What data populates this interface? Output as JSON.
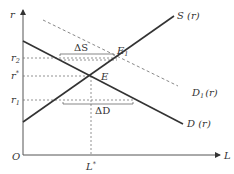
{
  "diagram": {
    "type": "supply-demand",
    "axes": {
      "y_label": "r",
      "x_label": "L",
      "origin_label": "O"
    },
    "y_ticks": [
      {
        "label": "r",
        "sub": "2",
        "y": 58
      },
      {
        "label": "r",
        "sup": "*",
        "y": 76
      },
      {
        "label": "r",
        "sub": "1",
        "y": 100
      }
    ],
    "x_ticks": [
      {
        "label": "L",
        "sup": "*",
        "x": 91
      }
    ],
    "curves": [
      {
        "name": "S (r)",
        "style": "solid"
      },
      {
        "name": "D (r)",
        "style": "solid"
      },
      {
        "name": "D1 (r)",
        "style": "dashed"
      }
    ],
    "points": {
      "E": "E",
      "E1": "E"
    },
    "annotations": {
      "delta_s": "ΔS",
      "delta_d": "ΔD"
    },
    "labels": {
      "S_curve": "S (r)",
      "D_curve": "D (r)",
      "D1_curve_main": "D",
      "D1_curve_sub": "1",
      "D1_curve_tail": "(r)",
      "E": "E",
      "E1_main": "E",
      "E1_sub": "1",
      "r_axis": "r",
      "L_axis": "L",
      "origin": "O",
      "r2_main": "r",
      "r2_sub": "2",
      "rstar_main": "r",
      "rstar_sup": "*",
      "r1_main": "r",
      "r1_sub": "1",
      "Lstar_main": "L",
      "Lstar_sup": "*"
    },
    "colors": {
      "line": "#333333",
      "dashed": "#777777"
    }
  }
}
